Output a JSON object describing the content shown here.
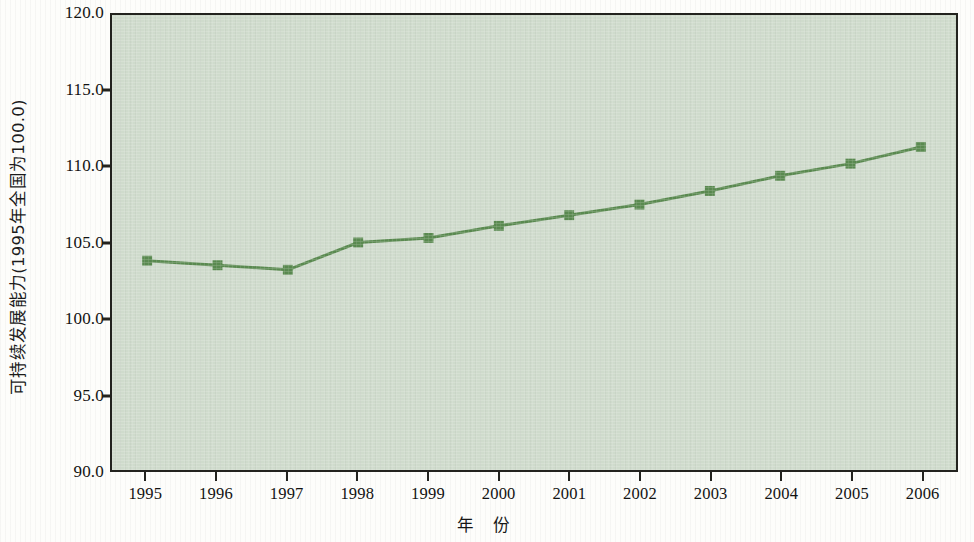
{
  "chart_data": {
    "type": "line",
    "title": "",
    "subtitle": "",
    "xlabel": "年  份",
    "ylabel": "可持续发展能力(1995年全国为100.0)",
    "categories": [
      "1995",
      "1996",
      "1997",
      "1998",
      "1999",
      "2000",
      "2001",
      "2002",
      "2003",
      "2004",
      "2005",
      "2006"
    ],
    "series": [
      {
        "name": "可持续发展能力",
        "values": [
          103.8,
          103.5,
          103.2,
          105.0,
          105.3,
          106.1,
          106.8,
          107.5,
          108.4,
          109.4,
          110.2,
          111.3
        ],
        "color": "#5a8a50",
        "marker": "square"
      }
    ],
    "ylim": [
      90.0,
      120.0
    ],
    "yticks": [
      "90.0",
      "95.0",
      "100.0",
      "105.0",
      "110.0",
      "115.0",
      "120.0"
    ],
    "ytick_values": [
      90.0,
      95.0,
      100.0,
      105.0,
      110.0,
      115.0,
      120.0
    ],
    "grid": false,
    "legend": false,
    "legend_position": "none",
    "plot_background": "#cfdbcc",
    "axis_color": "#23231f"
  }
}
